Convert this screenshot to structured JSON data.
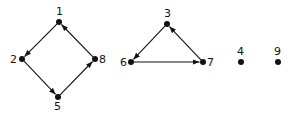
{
  "diagram": {
    "type": "directed-graph",
    "colors": {
      "ink": "#111111",
      "background": "#ffffff"
    },
    "nodes": [
      {
        "id": "1",
        "label": "1",
        "x": 59,
        "y": 22,
        "lx": 56,
        "ly": 15
      },
      {
        "id": "2",
        "label": "2",
        "x": 22,
        "y": 59,
        "lx": 10,
        "ly": 63
      },
      {
        "id": "8",
        "label": "8",
        "x": 95,
        "y": 59,
        "lx": 99,
        "ly": 63
      },
      {
        "id": "5",
        "label": "5",
        "x": 58,
        "y": 97,
        "lx": 54,
        "ly": 110
      },
      {
        "id": "3",
        "label": "3",
        "x": 167,
        "y": 24,
        "lx": 164,
        "ly": 17
      },
      {
        "id": "6",
        "label": "6",
        "x": 131,
        "y": 62,
        "lx": 120,
        "ly": 66
      },
      {
        "id": "7",
        "label": "7",
        "x": 203,
        "y": 62,
        "lx": 207,
        "ly": 66
      },
      {
        "id": "4",
        "label": "4",
        "x": 241,
        "y": 62,
        "lx": 237,
        "ly": 55
      },
      {
        "id": "9",
        "label": "9",
        "x": 278,
        "y": 62,
        "lx": 274,
        "ly": 55
      }
    ],
    "edges": [
      {
        "from": "1",
        "to": "2"
      },
      {
        "from": "2",
        "to": "5"
      },
      {
        "from": "5",
        "to": "8"
      },
      {
        "from": "8",
        "to": "1"
      },
      {
        "from": "3",
        "to": "6"
      },
      {
        "from": "6",
        "to": "7"
      },
      {
        "from": "7",
        "to": "3"
      }
    ]
  }
}
